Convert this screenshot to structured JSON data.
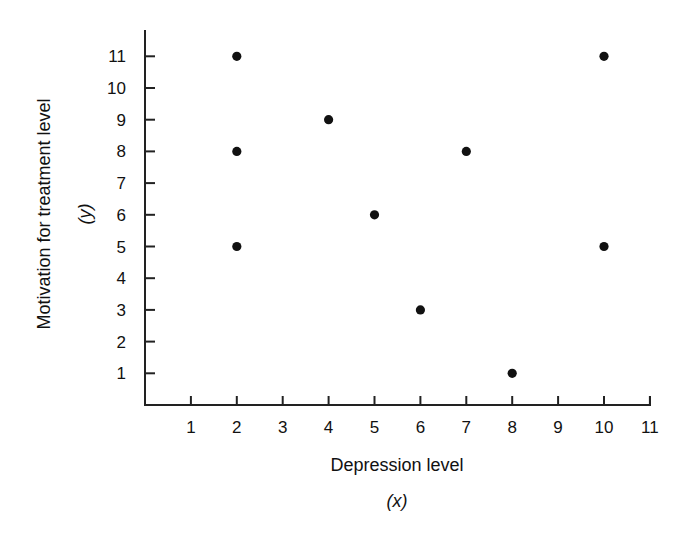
{
  "chart_data": {
    "type": "scatter",
    "title": "",
    "xlabel": "Depression level",
    "xlabel_var": "(x)",
    "ylabel": "Motivation for treatment level",
    "ylabel_var": "(y)",
    "xlim": [
      0,
      11
    ],
    "ylim": [
      0,
      11
    ],
    "x_ticks": [
      1,
      2,
      3,
      4,
      5,
      6,
      7,
      8,
      9,
      10,
      11
    ],
    "y_ticks": [
      1,
      2,
      3,
      4,
      5,
      6,
      7,
      8,
      9,
      10,
      11
    ],
    "grid": false,
    "legend": null,
    "marker_color": "#111111",
    "points": [
      {
        "x": 2,
        "y": 11
      },
      {
        "x": 2,
        "y": 8
      },
      {
        "x": 2,
        "y": 5
      },
      {
        "x": 4,
        "y": 9
      },
      {
        "x": 5,
        "y": 6
      },
      {
        "x": 6,
        "y": 3
      },
      {
        "x": 7,
        "y": 8
      },
      {
        "x": 8,
        "y": 1
      },
      {
        "x": 10,
        "y": 11
      },
      {
        "x": 10,
        "y": 5
      }
    ]
  }
}
